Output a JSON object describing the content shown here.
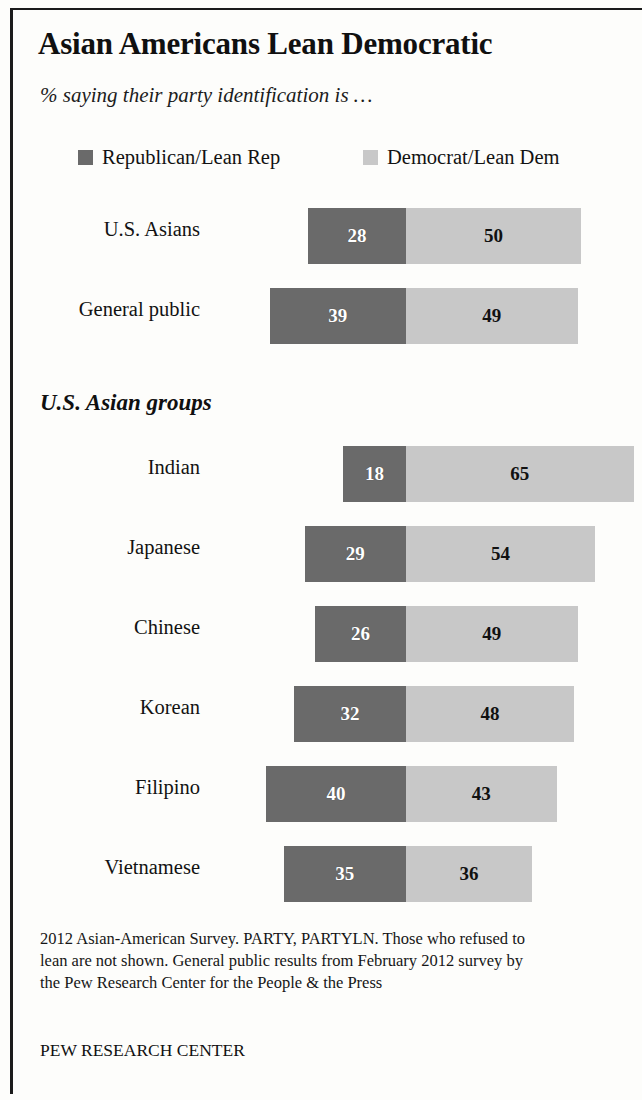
{
  "title": "Asian Americans Lean Democratic",
  "subtitle": "% saying their party identification is …",
  "section_header": "U.S. Asian groups",
  "footnote": "2012 Asian-American Survey. PARTY, PARTYLN. Those who refused to lean are not shown. General public results from February 2012 survey by the Pew Research Center for the People & the Press",
  "source": "PEW RESEARCH CENTER",
  "legend": {
    "republican": "Republican/Lean Rep",
    "democrat": "Democrat/Lean Dem"
  },
  "colors": {
    "republican": "#6a6a6a",
    "democrat": "#c8c8c8",
    "paper": "#fdfdfb",
    "ink": "#111111"
  },
  "chart_data": {
    "type": "bar",
    "subtype": "diverging-stacked-horizontal",
    "title": "Asian Americans Lean Democratic",
    "subtitle": "% saying their party identification is …",
    "xlabel": "",
    "ylabel": "",
    "grid": false,
    "legend_position": "top",
    "units": "percent",
    "note": "Bars diverge from a shared center axis: Republican/Lean Rep extends left, Democrat/Lean Dem extends right. The Indian row's Democrat bar is clipped by the right edge of the page.",
    "series": [
      {
        "name": "Republican/Lean Rep",
        "color": "#6a6a6a",
        "direction": "left"
      },
      {
        "name": "Democrat/Lean Dem",
        "color": "#c8c8c8",
        "direction": "right"
      }
    ],
    "groups": [
      {
        "name": "",
        "categories": [
          "U.S. Asians",
          "General public"
        ],
        "values": {
          "Republican/Lean Rep": [
            28,
            39
          ],
          "Democrat/Lean Dem": [
            50,
            49
          ]
        }
      },
      {
        "name": "U.S. Asian groups",
        "categories": [
          "Indian",
          "Japanese",
          "Chinese",
          "Korean",
          "Filipino",
          "Vietnamese"
        ],
        "values": {
          "Republican/Lean Rep": [
            18,
            29,
            26,
            32,
            40,
            35
          ],
          "Democrat/Lean Dem": [
            65,
            54,
            49,
            48,
            43,
            36
          ]
        }
      }
    ],
    "rows": [
      {
        "label": "U.S. Asians",
        "group": "overall",
        "rep": 28,
        "dem": 50
      },
      {
        "label": "General public",
        "group": "overall",
        "rep": 39,
        "dem": 49
      },
      {
        "label": "Indian",
        "group": "U.S. Asian groups",
        "rep": 18,
        "dem": 65
      },
      {
        "label": "Japanese",
        "group": "U.S. Asian groups",
        "rep": 29,
        "dem": 54
      },
      {
        "label": "Chinese",
        "group": "U.S. Asian groups",
        "rep": 26,
        "dem": 49
      },
      {
        "label": "Korean",
        "group": "U.S. Asian groups",
        "rep": 32,
        "dem": 48
      },
      {
        "label": "Filipino",
        "group": "U.S. Asian groups",
        "rep": 40,
        "dem": 43
      },
      {
        "label": "Vietnamese",
        "group": "U.S. Asian groups",
        "rep": 35,
        "dem": 36
      }
    ]
  },
  "layout": {
    "axis_x": 406,
    "px_per_point": 3.5,
    "row_tops": [
      208,
      288,
      446,
      526,
      606,
      686,
      766,
      846
    ],
    "bar_height": 56,
    "label_baseline_offset": 18
  }
}
